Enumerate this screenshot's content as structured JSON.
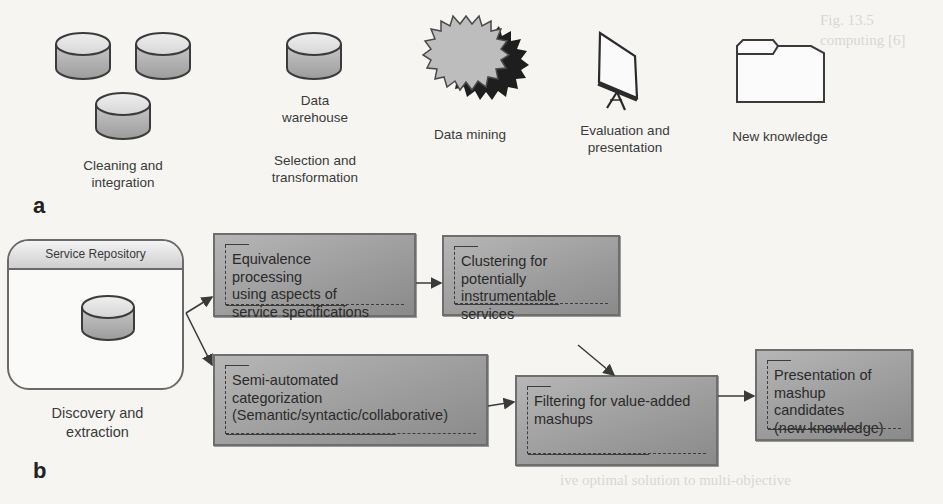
{
  "figure": {
    "panel_a": {
      "letter": "a",
      "steps": [
        {
          "icon": "database-cluster-icon",
          "label_lines": [
            "Cleaning and",
            "integration"
          ]
        },
        {
          "icon": "database-icon",
          "caption_lines": [
            "Data",
            "warehouse"
          ],
          "label_lines": [
            "Selection and",
            "transformation"
          ]
        },
        {
          "icon": "starburst-icon",
          "label_lines": [
            "Data mining"
          ]
        },
        {
          "icon": "presentation-easel-icon",
          "label_lines": [
            "Evaluation and",
            "presentation"
          ]
        },
        {
          "icon": "folder-icon",
          "label_lines": [
            "New knowledge"
          ]
        }
      ]
    },
    "panel_b": {
      "letter": "b",
      "repository": {
        "header": "Service Repository",
        "icon": "database-icon",
        "label_lines": [
          "Discovery and",
          "extraction"
        ]
      },
      "boxes": {
        "equivalence": "Equivalence\nprocessing\nusing aspects of\nservice specifications",
        "clustering": "Clustering for\npotentially\ninstrumentable services",
        "categorization": "Semi-automated\ncategorization\n(Semantic/syntactic/collaborative)",
        "filtering": "Filtering for value-added\nmashups",
        "presentation": "Presentation of\nmashup\ncandidates\n(new knowledge)"
      },
      "flows": [
        {
          "from": "repository",
          "to": "equivalence"
        },
        {
          "from": "repository",
          "to": "categorization"
        },
        {
          "from": "equivalence",
          "to": "clustering"
        },
        {
          "from": "clustering",
          "to": "filtering"
        },
        {
          "from": "categorization",
          "to": "filtering"
        },
        {
          "from": "filtering",
          "to": "presentation"
        }
      ]
    },
    "colors": {
      "box_fill": "#a3a3a3",
      "box_border": "#6e6e6e",
      "arrow": "#3a3a3a",
      "background": "#f6f5f2"
    }
  }
}
